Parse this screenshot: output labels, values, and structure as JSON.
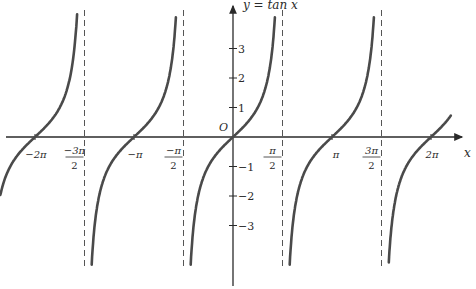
{
  "chart_data": {
    "type": "line",
    "title": "y = tan x",
    "function": "tan",
    "xlabel": "x",
    "ylabel": "y = tan x",
    "origin_label": "O",
    "xlim": [
      -2.35,
      2.2
    ],
    "ylim": [
      -4.6,
      4.6
    ],
    "x_unit": "pi",
    "x_ticks": [
      {
        "value": -2.0,
        "label": "−2π"
      },
      {
        "value": -1.5,
        "label_num": "−3π",
        "label_den": "2"
      },
      {
        "value": -1.0,
        "label": "−π"
      },
      {
        "value": -0.5,
        "label_num": "−π",
        "label_den": "2"
      },
      {
        "value": 0.5,
        "label_num": "π",
        "label_den": "2"
      },
      {
        "value": 1.0,
        "label": "π"
      },
      {
        "value": 1.5,
        "label_num": "3π",
        "label_den": "2"
      },
      {
        "value": 2.0,
        "label": "2π"
      }
    ],
    "y_ticks": [
      {
        "value": 3,
        "label": "3"
      },
      {
        "value": 2,
        "label": "2"
      },
      {
        "value": 1,
        "label": "1"
      },
      {
        "value": -1,
        "label": "−1"
      },
      {
        "value": -2,
        "label": "−2"
      },
      {
        "value": -3,
        "label": "−3"
      }
    ],
    "asymptotes_pi": [
      -1.5,
      -0.5,
      0.5,
      1.5
    ],
    "zeros_pi": [
      -2,
      -1,
      0,
      1,
      2
    ],
    "series": [
      {
        "name": "branch-1",
        "x_range_pi": [
          -2.35,
          -1.53
        ]
      },
      {
        "name": "branch-2",
        "x_range_pi": [
          -1.47,
          -0.53
        ]
      },
      {
        "name": "branch-3",
        "x_range_pi": [
          -0.47,
          0.47
        ]
      },
      {
        "name": "branch-4",
        "x_range_pi": [
          0.53,
          1.47
        ]
      },
      {
        "name": "branch-5",
        "x_range_pi": [
          1.53,
          2.2
        ]
      }
    ],
    "sample_points": [
      {
        "x": "0",
        "y": 0
      },
      {
        "x": "π/4",
        "y": 1
      },
      {
        "x": "-π/4",
        "y": -1
      },
      {
        "x": "π",
        "y": 0
      },
      {
        "x": "-π",
        "y": 0
      },
      {
        "x": "2π",
        "y": 0
      },
      {
        "x": "-2π",
        "y": 0
      }
    ],
    "grid": false,
    "legend": null
  },
  "style": {
    "curve_color": "#4a4a4a",
    "axis_color": "#2a2a2a",
    "asymptote_color": "#555555"
  }
}
